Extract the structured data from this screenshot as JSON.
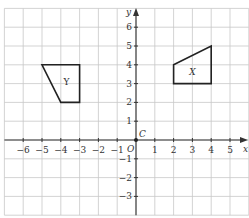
{
  "diagram": {
    "type": "coordinate-grid",
    "origin_px": [
      136,
      140
    ],
    "unit_px": 18.8,
    "x_range": [
      -7,
      6
    ],
    "y_range": [
      -4,
      7
    ],
    "axis_labels": {
      "x": "x",
      "y": "y",
      "origin": "O"
    },
    "x_ticks": [
      -6,
      -5,
      -4,
      -3,
      -2,
      -1,
      1,
      2,
      3,
      4,
      5
    ],
    "y_ticks": [
      -3,
      -2,
      -1,
      1,
      2,
      3,
      4,
      5,
      6
    ],
    "x_tick_labels": [
      "−6",
      "−5",
      "−4",
      "−3",
      "−2",
      "−1",
      "1",
      "2",
      "3",
      "4",
      "5"
    ],
    "y_tick_labels": [
      "−3",
      "−2",
      "−1",
      "1",
      "2",
      "3",
      "4",
      "5",
      "6"
    ],
    "point": {
      "label": "C",
      "coords": [
        0,
        0
      ]
    },
    "shapes": [
      {
        "label": "Y",
        "vertices": [
          [
            -5,
            4
          ],
          [
            -3,
            4
          ],
          [
            -3,
            2
          ],
          [
            -4,
            2
          ]
        ],
        "label_pos": [
          -3.7,
          3.1
        ]
      },
      {
        "label": "X",
        "vertices": [
          [
            2,
            4
          ],
          [
            4,
            5
          ],
          [
            4,
            3
          ],
          [
            2,
            3
          ]
        ],
        "label_pos": [
          3,
          3.6
        ]
      }
    ],
    "colors": {
      "grid": "#c8c8c8",
      "axis": "#333333",
      "shape": "#222222",
      "background": "#ffffff"
    }
  }
}
